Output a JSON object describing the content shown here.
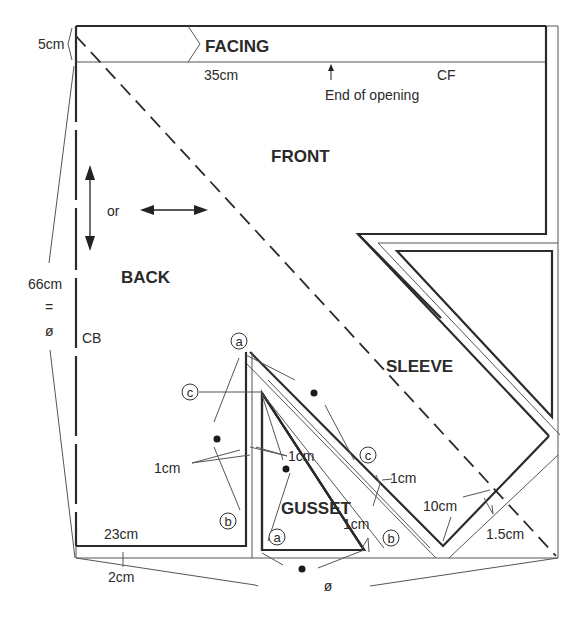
{
  "pieces": {
    "facing": "FACING",
    "front": "FRONT",
    "back": "BACK",
    "sleeve": "SLEEVE",
    "gusset": "GUSSET"
  },
  "labels": {
    "facing_depth": "5cm",
    "facing_width": "35cm",
    "cf": "CF",
    "end_of_opening": "End of opening",
    "grain_or": "or",
    "total_length": "66cm",
    "equals": "=",
    "diameter": "ø",
    "cb": "CB",
    "back_width": "23cm",
    "hem_allowance": "2cm",
    "sleeve_width": "10cm",
    "sleeve_offset": "1.5cm",
    "seam_1cm": "1cm",
    "bottom_diameter": "ø"
  },
  "markers": {
    "a": "a",
    "b": "b",
    "c": "c"
  }
}
